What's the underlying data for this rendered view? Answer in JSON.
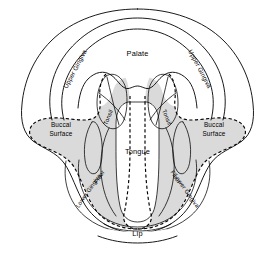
{
  "figure": {
    "background_color": "#ffffff",
    "shaded_color": "#dadada",
    "line_color": "#000000"
  },
  "labels": {
    "palate": "Palate",
    "tongue": "Tongue",
    "lip": "Lip",
    "upper_gingiva_left": "Upper Gingiva",
    "upper_gingiva_right": "Upper Gingiva",
    "lower_gingiva_left": "Lower Gingiva",
    "lower_gingiva_right": "Lower Gingiva",
    "buccal_surface_left_line1": "Buccal",
    "buccal_surface_left_line2": "Surface",
    "buccal_surface_right_line1": "Buccal",
    "buccal_surface_right_line2": "Surface",
    "tonsil_left": "Tonsil",
    "tonsil_right": "Tonsil",
    "floor_left": "Floor",
    "floor_right": "Floor"
  },
  "regions": [
    {
      "name": "palate",
      "label": "Palate",
      "shaded": false
    },
    {
      "name": "upper-gingiva",
      "label": "Upper Gingiva",
      "shaded": false
    },
    {
      "name": "tonsil",
      "label": "Tonsil",
      "shaded": true
    },
    {
      "name": "buccal-surface",
      "label": "Buccal Surface",
      "shaded": true
    },
    {
      "name": "tongue",
      "label": "Tongue",
      "shaded": false
    },
    {
      "name": "floor",
      "label": "Floor",
      "shaded": true
    },
    {
      "name": "lower-gingiva",
      "label": "Lower Gingiva",
      "shaded": true
    },
    {
      "name": "lip",
      "label": "Lip",
      "shaded": false
    }
  ]
}
